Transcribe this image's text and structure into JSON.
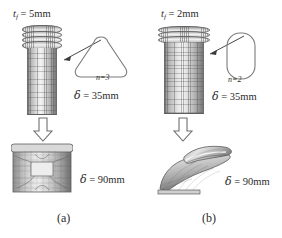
{
  "figure": {
    "type": "simulation-figure",
    "background": "#ffffff",
    "ink_color": "#2b2b2b"
  },
  "panels": [
    {
      "id": "a",
      "caption": "(a)",
      "thickness_label": {
        "symbol": "t",
        "subscript": "f",
        "equals": "=",
        "value": "5mm",
        "full": "t_f = 5mm"
      },
      "cross_section": {
        "shape": "rounded-triangle",
        "lobes_label": "n=3",
        "lobes_count": 3
      },
      "states": [
        {
          "stage": "intermediate",
          "displacement_label": "= 35mm",
          "displacement_symbol": "δ",
          "displacement_value": 35,
          "units": "mm",
          "mode": "progressive-folding"
        },
        {
          "stage": "final",
          "displacement_label": "= 90mm",
          "displacement_symbol": "δ",
          "displacement_value": 90,
          "units": "mm",
          "mode": "concertina-crush"
        }
      ],
      "arrow": {
        "name": "down-block-arrow",
        "direction": "down"
      }
    },
    {
      "id": "b",
      "caption": "(b)",
      "thickness_label": {
        "symbol": "t",
        "subscript": "f",
        "equals": "=",
        "value": "2mm",
        "full": "t_f = 2mm"
      },
      "cross_section": {
        "shape": "stadium-oval",
        "lobes_label": "n=2",
        "lobes_count": 2
      },
      "states": [
        {
          "stage": "intermediate",
          "displacement_label": "= 35mm",
          "displacement_symbol": "δ",
          "displacement_value": 35,
          "units": "mm",
          "mode": "diamond-buckling"
        },
        {
          "stage": "final",
          "displacement_label": "= 90mm",
          "displacement_symbol": "δ",
          "displacement_value": 90,
          "units": "mm",
          "mode": "global-bending-collapse"
        }
      ],
      "arrow": {
        "name": "down-block-arrow",
        "direction": "down"
      }
    }
  ]
}
